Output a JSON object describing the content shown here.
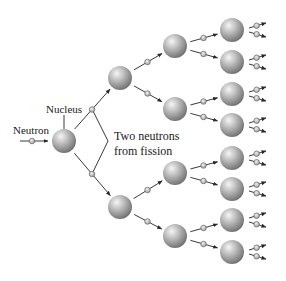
{
  "diagram": {
    "labels": {
      "neutron": "Neutron",
      "nucleus": "Nucleus",
      "fission_line1": "Two neutrons",
      "fission_line2": "from fission"
    },
    "colors": {
      "nucleus_light": "#f4f4f4",
      "nucleus_mid": "#b4b4b4",
      "nucleus_dark": "#6e6e6e",
      "neutron_fill": "#c8c8c8",
      "line": "#3a3a3a",
      "text": "#1a1a1a"
    },
    "nucleus_radius": 12,
    "neutron_radius": 2.8,
    "nuclei": [
      {
        "id": "n0",
        "level": 0,
        "x": 64,
        "y": 141
      },
      {
        "id": "n1a",
        "level": 1,
        "x": 120,
        "y": 78
      },
      {
        "id": "n1b",
        "level": 1,
        "x": 120,
        "y": 207
      },
      {
        "id": "n2a",
        "level": 2,
        "x": 175,
        "y": 46
      },
      {
        "id": "n2b",
        "level": 2,
        "x": 175,
        "y": 109
      },
      {
        "id": "n2c",
        "level": 2,
        "x": 175,
        "y": 173
      },
      {
        "id": "n2d",
        "level": 2,
        "x": 175,
        "y": 236
      },
      {
        "id": "n3a",
        "level": 3,
        "x": 232,
        "y": 30
      },
      {
        "id": "n3b",
        "level": 3,
        "x": 232,
        "y": 62
      },
      {
        "id": "n3c",
        "level": 3,
        "x": 232,
        "y": 94
      },
      {
        "id": "n3d",
        "level": 3,
        "x": 232,
        "y": 125
      },
      {
        "id": "n3e",
        "level": 3,
        "x": 232,
        "y": 158
      },
      {
        "id": "n3f",
        "level": 3,
        "x": 232,
        "y": 189
      },
      {
        "id": "n3g",
        "level": 3,
        "x": 232,
        "y": 220
      },
      {
        "id": "n3h",
        "level": 3,
        "x": 232,
        "y": 252
      }
    ],
    "children": {
      "n0": [
        "n1a",
        "n1b"
      ],
      "n1a": [
        "n2a",
        "n2b"
      ],
      "n1b": [
        "n2c",
        "n2d"
      ],
      "n2a": [
        "n3a",
        "n3b"
      ],
      "n2b": [
        "n3c",
        "n3d"
      ],
      "n2c": [
        "n3e",
        "n3f"
      ],
      "n2d": [
        "n3g",
        "n3h"
      ]
    },
    "incoming_neutron": {
      "x1": 20,
      "y1": 141,
      "x2": 48,
      "y2": 141,
      "nx": 32,
      "ny": 141
    },
    "outgoing_final": {
      "dx_start": 17,
      "dx_end": 34,
      "dy": 7
    }
  }
}
